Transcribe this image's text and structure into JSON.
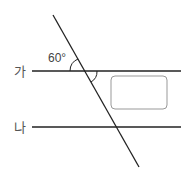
{
  "diagram": {
    "line_labels": [
      "가",
      "나"
    ],
    "given_angle": "60°",
    "unknown_angle_box": "",
    "colors": {
      "line": "#222222",
      "box": "#999999",
      "text": "#555555"
    }
  }
}
